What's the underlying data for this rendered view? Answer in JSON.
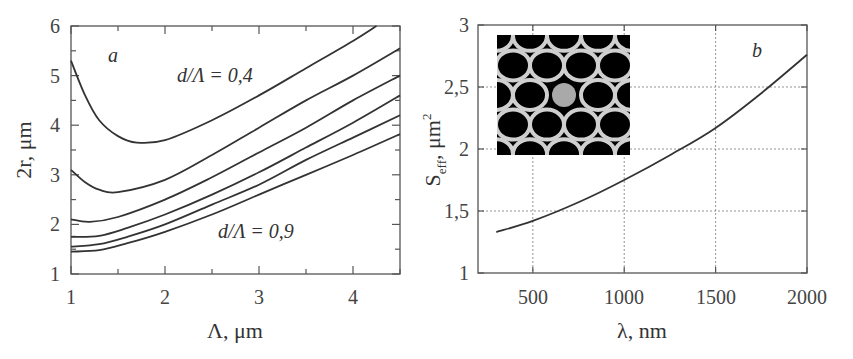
{
  "chart_data": [
    {
      "panel": "a",
      "type": "line",
      "xlabel": "Λ, μm",
      "ylabel": "2r, μm",
      "xlim": [
        1,
        4.5
      ],
      "ylim": [
        1,
        6
      ],
      "xticks": [
        "1",
        "2",
        "3",
        "4"
      ],
      "yticks": [
        "1",
        "2",
        "3",
        "4",
        "5",
        "6"
      ],
      "grid": false,
      "annotations": [
        {
          "text": "a",
          "x": 1.4,
          "y": 5.45
        },
        {
          "text": "d/Λ = 0,4",
          "x": 2.45,
          "y": 4.65
        },
        {
          "text": "d/Λ = 0,9",
          "x": 2.95,
          "y": 1.85
        }
      ],
      "series": [
        {
          "name": "d/Λ=0.4",
          "x": [
            1,
            1.15,
            1.3,
            1.5,
            1.7,
            2,
            2.5,
            3,
            3.5,
            4,
            4.25
          ],
          "y": [
            5.3,
            4.6,
            4.1,
            3.78,
            3.65,
            3.7,
            4.1,
            4.6,
            5.15,
            5.7,
            6.0
          ]
        },
        {
          "name": "d/Λ=0.5",
          "x": [
            1,
            1.15,
            1.3,
            1.5,
            2,
            2.5,
            3,
            3.5,
            4,
            4.5
          ],
          "y": [
            3.1,
            2.85,
            2.7,
            2.65,
            2.9,
            3.4,
            3.95,
            4.5,
            5.0,
            5.55
          ]
        },
        {
          "name": "d/Λ=0.6",
          "x": [
            1,
            1.2,
            1.5,
            2,
            2.5,
            3,
            3.5,
            4,
            4.5
          ],
          "y": [
            2.1,
            2.05,
            2.15,
            2.5,
            2.95,
            3.45,
            3.95,
            4.5,
            5.0
          ]
        },
        {
          "name": "d/Λ=0.7",
          "x": [
            1,
            1.3,
            1.6,
            2,
            2.5,
            3,
            3.5,
            4,
            4.5
          ],
          "y": [
            1.75,
            1.77,
            1.93,
            2.2,
            2.6,
            3.05,
            3.55,
            4.05,
            4.6
          ]
        },
        {
          "name": "d/Λ=0.8",
          "x": [
            1,
            1.3,
            1.6,
            2,
            2.5,
            3,
            3.5,
            4,
            4.5
          ],
          "y": [
            1.55,
            1.6,
            1.75,
            2.0,
            2.4,
            2.8,
            3.3,
            3.75,
            4.2
          ]
        },
        {
          "name": "d/Λ=0.9",
          "x": [
            1,
            1.3,
            1.6,
            2,
            2.5,
            3,
            3.5,
            4,
            4.5
          ],
          "y": [
            1.45,
            1.48,
            1.62,
            1.85,
            2.2,
            2.6,
            3.0,
            3.4,
            3.82
          ]
        }
      ]
    },
    {
      "panel": "b",
      "type": "line",
      "xlabel": "λ, nm",
      "ylabel": "S_eff, μm²",
      "xlim": [
        200,
        2000
      ],
      "ylim": [
        1,
        3
      ],
      "xticks": [
        "500",
        "1000",
        "1500",
        "2000"
      ],
      "yticks": [
        "1",
        "1,5",
        "2",
        "2,5",
        "3"
      ],
      "grid": true,
      "annotations": [
        {
          "text": "b",
          "x": 1780,
          "y": 2.8
        }
      ],
      "inset": "photonic crystal fiber cross-section micrograph (hexagonal air-hole lattice with solid core)",
      "series": [
        {
          "name": "S_eff",
          "x": [
            300,
            500,
            750,
            1000,
            1250,
            1500,
            1750,
            2000
          ],
          "y": [
            1.33,
            1.42,
            1.57,
            1.75,
            1.95,
            2.17,
            2.45,
            2.76
          ]
        }
      ]
    }
  ],
  "labels": {
    "a": {
      "xlabel_main": "Λ, μm",
      "ylabel_main": "2r, μm",
      "panel": "a",
      "top_annotation": "d/Λ = 0,4",
      "bottom_annotation": "d/Λ = 0,9",
      "xticks": [
        "1",
        "2",
        "3",
        "4"
      ],
      "yticks": [
        "1",
        "2",
        "3",
        "4",
        "5",
        "6"
      ]
    },
    "b": {
      "xlabel_main": "λ, nm",
      "ylabel_S": "S",
      "ylabel_sub": "eff",
      "ylabel_rest": ", μm",
      "ylabel_sup": "2",
      "panel": "b",
      "xticks": [
        "500",
        "1000",
        "1500",
        "2000"
      ],
      "yticks": [
        "1",
        "1,5",
        "2",
        "2,5",
        "3"
      ]
    }
  }
}
